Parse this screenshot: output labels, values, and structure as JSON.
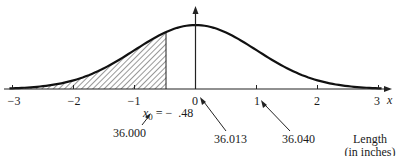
{
  "chart_data": {
    "type": "area",
    "title": "",
    "xlabel": "x",
    "ylabel": "",
    "xlim": [
      -3,
      3
    ],
    "x_ticks": [
      -3,
      -2,
      -1,
      0,
      1,
      2,
      3
    ],
    "x_tick_labels": [
      "−3",
      "−2",
      "−1",
      "0",
      "1",
      "2",
      "3"
    ],
    "shaded_region": {
      "from": -3,
      "to": -0.48,
      "pattern": "diagonal hatch"
    },
    "annotations": [
      {
        "text": "x0 = − .48",
        "x": -0.48
      },
      {
        "text": "36.000",
        "points_to": -0.48
      },
      {
        "text": "36.013",
        "points_to": 0
      },
      {
        "text": "36.040",
        "points_to": 1
      },
      {
        "text": "Length (in inches)"
      }
    ]
  },
  "labels": {
    "axis_x": "x",
    "ticks": [
      "−3",
      "−2",
      "−1",
      "0",
      "1",
      "2",
      "3"
    ],
    "x0_var": "x",
    "x0_sub": "0",
    "x0_rest": " = −  .48",
    "val1": "36.000",
    "val2": "36.013",
    "val3": "36.040",
    "length_1": "Length",
    "length_2": "(in inches)"
  }
}
